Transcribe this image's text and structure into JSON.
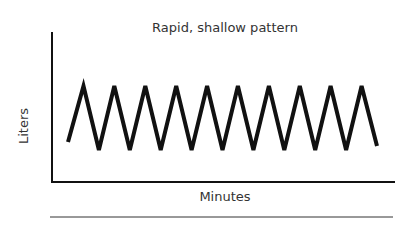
{
  "chart_data": {
    "type": "line",
    "title": "Rapid, shallow pattern",
    "xlabel": "Minutes",
    "ylabel": "Liters",
    "grid": false,
    "legend": null,
    "x": [
      0,
      1,
      2,
      3,
      4,
      5,
      6,
      7,
      8,
      9,
      10,
      11,
      12,
      13,
      14,
      15,
      16,
      17,
      18,
      19,
      20
    ],
    "series": [
      {
        "name": "Breathing volume",
        "values": [
          0.3,
          1,
          0.2,
          1,
          0.2,
          1,
          0.2,
          1,
          0.2,
          1,
          0.2,
          1,
          0.2,
          1,
          0.2,
          1,
          0.2,
          1,
          0.2,
          1,
          0.25
        ]
      }
    ],
    "peaks": 10
  },
  "figure": {
    "title": "Rapid, shallow pattern",
    "xlabel": "Minutes",
    "ylabel": "Liters"
  }
}
